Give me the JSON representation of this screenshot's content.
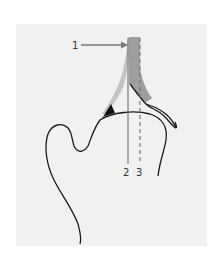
{
  "diagram": {
    "labels": [
      {
        "id": "1",
        "text": "1"
      },
      {
        "id": "2",
        "text": "2"
      },
      {
        "id": "3",
        "text": "3"
      }
    ],
    "colors": {
      "panel": "#f1f1f1",
      "bone_outline": "#1a1a1a",
      "cartilage_gray": "#a0a0a0",
      "light_gray_band": "#c8c8c8",
      "reference_line": "#7a7a7a",
      "wedge": "#111111"
    }
  }
}
